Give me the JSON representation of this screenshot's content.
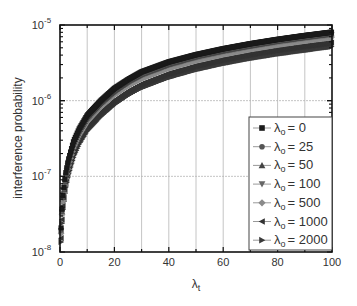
{
  "chart_data": {
    "type": "scatter",
    "title": "",
    "xlabel": "λt",
    "xlabel_base": "λ",
    "xlabel_sub": "t",
    "ylabel": "interference probability",
    "xlim": [
      0,
      100
    ],
    "ylim": [
      1e-08,
      1e-05
    ],
    "yscale": "log",
    "grid": true,
    "legend_position": "lower right",
    "x_ticks": [
      0,
      20,
      40,
      60,
      80,
      100
    ],
    "x_tick_labels": [
      "0",
      "20",
      "40",
      "60",
      "80",
      "100"
    ],
    "y_ticks": [
      1e-08,
      1e-07,
      1e-06,
      1e-05
    ],
    "y_tick_labels": [
      {
        "base": "10",
        "exp": "-8"
      },
      {
        "base": "10",
        "exp": "-7"
      },
      {
        "base": "10",
        "exp": "-6"
      },
      {
        "base": "10",
        "exp": "-5"
      }
    ],
    "x": [
      0.5,
      1,
      2,
      3,
      5,
      7,
      10,
      15,
      20,
      25,
      30,
      40,
      50,
      60,
      70,
      80,
      90,
      100
    ],
    "series": [
      {
        "name": "λo = 0",
        "label_base": "λ",
        "label_sub": "o",
        "label_value": "= 0",
        "marker": "square",
        "color": "#1a1a1a",
        "values": [
          2.6e-08,
          5.2e-08,
          1.05e-07,
          1.6e-07,
          2.9e-07,
          4.2e-07,
          6.4e-07,
          1e-06,
          1.45e-06,
          1.9e-06,
          2.4e-06,
          3.25e-06,
          4.05e-06,
          4.85e-06,
          5.65e-06,
          6.45e-06,
          7.25e-06,
          8.05e-06
        ]
      },
      {
        "name": "λo = 25",
        "label_base": "λ",
        "label_sub": "o",
        "label_value": "= 25",
        "marker": "circle",
        "color": "#555555",
        "values": [
          2.5e-08,
          5e-08,
          1e-07,
          1.55e-07,
          2.8e-07,
          4.05e-07,
          6.2e-07,
          9.7e-07,
          1.4e-06,
          1.85e-06,
          2.3e-06,
          3.15e-06,
          3.95e-06,
          4.75e-06,
          5.5e-06,
          6.3e-06,
          7.1e-06,
          7.9e-06
        ]
      },
      {
        "name": "λo = 50",
        "label_base": "λ",
        "label_sub": "o",
        "label_value": "= 50",
        "marker": "triangle-up",
        "color": "#444444",
        "values": [
          2.45e-08,
          4.9e-08,
          9.8e-08,
          1.5e-07,
          2.7e-07,
          3.95e-07,
          6e-07,
          9.4e-07,
          1.35e-06,
          1.8e-06,
          2.25e-06,
          3.05e-06,
          3.85e-06,
          4.6e-06,
          5.35e-06,
          6.15e-06,
          6.9e-06,
          7.7e-06
        ]
      },
      {
        "name": "λo = 100",
        "label_base": "λ",
        "label_sub": "o",
        "label_value": "= 100",
        "marker": "triangle-down",
        "color": "#666666",
        "values": [
          2.4e-08,
          4.75e-08,
          9.5e-08,
          1.45e-07,
          2.6e-07,
          3.8e-07,
          5.8e-07,
          9.1e-07,
          1.3e-06,
          1.72e-06,
          2.15e-06,
          2.95e-06,
          3.7e-06,
          4.45e-06,
          5.2e-06,
          5.95e-06,
          6.7e-06,
          7.45e-06
        ]
      },
      {
        "name": "λo = 500",
        "label_base": "λ",
        "label_sub": "o",
        "label_value": "= 500",
        "marker": "diamond",
        "color": "#8a8a8a",
        "values": [
          2.2e-08,
          4.4e-08,
          8.8e-08,
          1.33e-07,
          2.4e-07,
          3.5e-07,
          5.3e-07,
          8.3e-07,
          1.2e-06,
          1.58e-06,
          1.97e-06,
          2.7e-06,
          3.4e-06,
          4.1e-06,
          4.8e-06,
          5.5e-06,
          6.2e-06,
          6.9e-06
        ]
      },
      {
        "name": "λo = 1000",
        "label_base": "λ",
        "label_sub": "o",
        "label_value": "= 1000",
        "marker": "triangle-left",
        "color": "#333333",
        "values": [
          1.9e-08,
          3.8e-08,
          7.6e-08,
          1.15e-07,
          2.05e-07,
          3e-07,
          4.5e-07,
          7e-07,
          1e-06,
          1.33e-06,
          1.66e-06,
          2.28e-06,
          2.88e-06,
          3.48e-06,
          4.08e-06,
          4.68e-06,
          5.25e-06,
          5.85e-06
        ]
      },
      {
        "name": "λo = 2000",
        "label_base": "λ",
        "label_sub": "o",
        "label_value": "= 2000",
        "marker": "triangle-right",
        "color": "#3a3a3a",
        "values": [
          1.7e-08,
          3.4e-08,
          6.8e-08,
          1.02e-07,
          1.82e-07,
          2.65e-07,
          4e-07,
          6.2e-07,
          8.9e-07,
          1.18e-06,
          1.48e-06,
          2.03e-06,
          2.57e-06,
          3.1e-06,
          3.63e-06,
          4.15e-06,
          4.65e-06,
          5.2e-06
        ]
      }
    ]
  }
}
